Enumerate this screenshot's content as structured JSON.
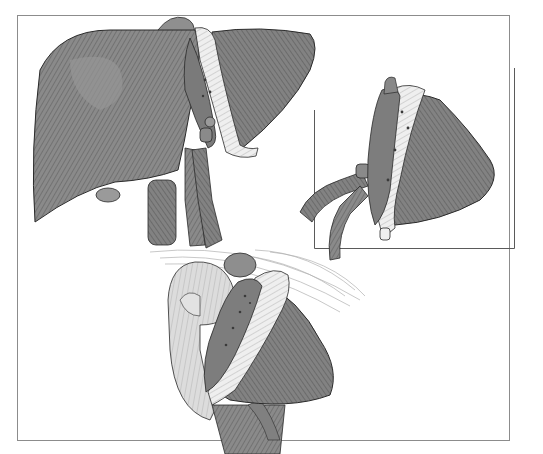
{
  "figure": {
    "panels": [
      {
        "id": "whole-liver",
        "label": "Whole liver with hilar vessels"
      },
      {
        "id": "graft-inset",
        "label": "Left lateral segment graft with vessels"
      },
      {
        "id": "implanted-graft",
        "label": "Graft implanted with diaphragm and anastomoses"
      }
    ],
    "colors": {
      "liver_dark": "#6f6f6f",
      "liver_mid": "#8a8a8a",
      "liver_light": "#a5a5a5",
      "capsule": "#e9e9e9",
      "organ_pale": "#d8d8d8",
      "outline": "#2a2a2a",
      "frame": "#8c8c8c"
    }
  }
}
